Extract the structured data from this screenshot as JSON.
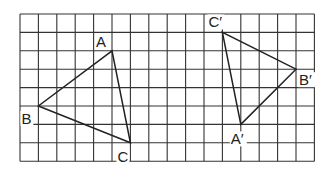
{
  "grid": {
    "cols": 16,
    "rows": 8,
    "left": 20,
    "top": 14,
    "cell": 18.4,
    "color": "#333333"
  },
  "triangles": [
    {
      "name": "ABC",
      "vertices": [
        {
          "label": "A",
          "col": 5,
          "row": 2,
          "lx": -16,
          "ly": -4
        },
        {
          "label": "B",
          "col": 1,
          "row": 5,
          "lx": -17,
          "ly": 18
        },
        {
          "label": "C",
          "col": 6,
          "row": 7,
          "lx": -13,
          "ly": 19
        }
      ]
    },
    {
      "name": "A'B'C'",
      "vertices": [
        {
          "label": "A′",
          "col": 12,
          "row": 6,
          "lx": -10,
          "ly": 20
        },
        {
          "label": "B′",
          "col": 15,
          "row": 3,
          "lx": 3,
          "ly": 16
        },
        {
          "label": "C′",
          "col": 11,
          "row": 1,
          "lx": -14,
          "ly": -5
        }
      ]
    }
  ]
}
